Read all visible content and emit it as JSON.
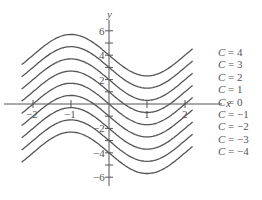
{
  "chart_data": {
    "type": "line",
    "title": "",
    "xlabel": "x",
    "ylabel": "y",
    "xlim": [
      -2.3,
      2.5
    ],
    "ylim": [
      -6.5,
      7
    ],
    "x_ticks": [
      -2,
      -1,
      1,
      2
    ],
    "x_tick_labels": [
      "-2",
      "-1",
      "1",
      "2"
    ],
    "y_ticks": [
      6,
      5,
      4,
      3,
      2,
      1,
      -1,
      -2,
      -3,
      -4,
      -5,
      -6
    ],
    "y_tick_labels": {
      "6": "6",
      "4": "4",
      "2": "2",
      "-2": "−2",
      "-4": "−4",
      "-6": "−6"
    },
    "grid": false,
    "family_description": "Family of curves y = f(x) + C, local max near x = -1, local min near x = 1",
    "series": [
      {
        "name": "C = 4",
        "C": 4
      },
      {
        "name": "C = 3",
        "C": 3
      },
      {
        "name": "C = 2",
        "C": 2
      },
      {
        "name": "C = 1",
        "C": 1
      },
      {
        "name": "C = 0",
        "C": 0
      },
      {
        "name": "C = −1",
        "C": -1
      },
      {
        "name": "C = −2",
        "C": -2
      },
      {
        "name": "C = −3",
        "C": -3
      },
      {
        "name": "C = −4",
        "C": -4
      }
    ],
    "legend_position": "right, inline labels at curve ends"
  },
  "layout": {
    "origin_px": [
      109,
      104
    ],
    "x_px_per_unit": 38,
    "y_px_per_unit": 12.2,
    "amplitude": 1.7
  }
}
